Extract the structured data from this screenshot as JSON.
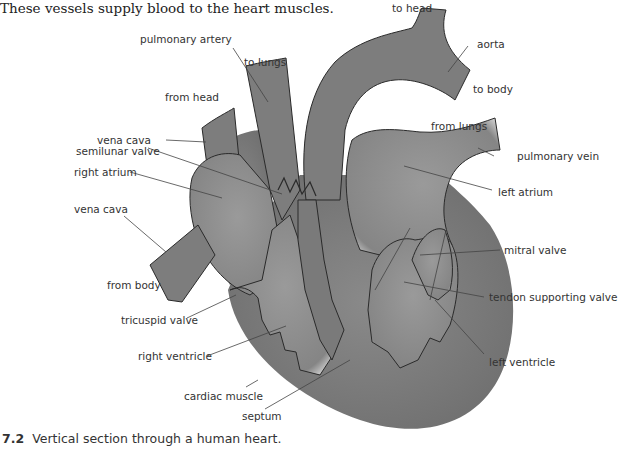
{
  "intro_text": "These vessels supply blood to the heart muscles.",
  "caption": {
    "number": "7.2",
    "text": "Vertical section through a human heart."
  },
  "labels": {
    "to_head": "to head",
    "aorta": "aorta",
    "to_body": "to body",
    "pulmonary_artery": "pulmonary artery",
    "to_lungs": "to lungs",
    "from_head": "from head",
    "vena_cava_upper": "vena cava",
    "semilunar_valve": "semilunar valve",
    "right_atrium": "right atrium",
    "vena_cava_lower": "vena cava",
    "from_lungs": "from lungs",
    "pulmonary_vein": "pulmonary vein",
    "left_atrium": "left atrium",
    "mitral_valve": "mitral valve",
    "from_body": "from body",
    "tendon_supporting_valve": "tendon supporting valve",
    "tricuspid_valve": "tricuspid valve",
    "right_ventricle": "right ventricle",
    "left_ventricle": "left ventricle",
    "cardiac_muscle": "cardiac muscle",
    "septum": "septum"
  },
  "colors": {
    "tissue": "#7a7a7a",
    "chamber": "#8e8e8e",
    "outline": "#2a2a2a",
    "leader": "#444444"
  }
}
